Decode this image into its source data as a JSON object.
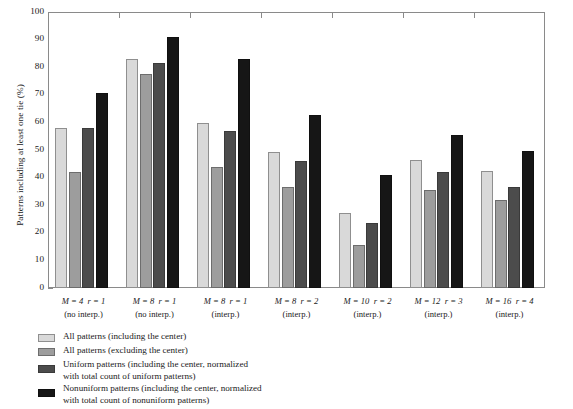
{
  "chart_data": {
    "type": "bar",
    "title": "",
    "xlabel": "",
    "ylabel": "Patterns including at least one tie (%)",
    "ylim": [
      0,
      100
    ],
    "ytick_labels": [
      "0",
      "10",
      "20",
      "30",
      "40",
      "50",
      "60",
      "70",
      "80",
      "90",
      "100"
    ],
    "ytick_values": [
      0,
      10,
      20,
      30,
      40,
      50,
      60,
      70,
      80,
      90,
      100
    ],
    "grid": false,
    "legend_position": "below-plot-left",
    "categories": [
      {
        "line1": "M = 4  r = 1",
        "line2": "(no interp.)",
        "M": "4",
        "r": "1"
      },
      {
        "line1": "M = 8  r = 1",
        "line2": "(no interp.)",
        "M": "8",
        "r": "1"
      },
      {
        "line1": "M = 8  r = 1",
        "line2": "(interp.)",
        "M": "8",
        "r": "1"
      },
      {
        "line1": "M = 8  r = 2",
        "line2": "(interp.)",
        "M": "8",
        "r": "2"
      },
      {
        "line1": "M = 10  r = 2",
        "line2": "(interp.)",
        "M": "10",
        "r": "2"
      },
      {
        "line1": "M = 12  r = 3",
        "line2": "(interp.)",
        "M": "12",
        "r": "3"
      },
      {
        "line1": "M = 16  r = 4",
        "line2": "(interp.)",
        "M": "16",
        "r": "4"
      }
    ],
    "series": [
      {
        "name": "All patterns (including the center)",
        "color": "#d9d9d9",
        "values": [
          58.0,
          83.0,
          59.8,
          49.2,
          27.2,
          46.5,
          42.5
        ]
      },
      {
        "name": "All patterns (excluding the center)",
        "color": "#9d9d9d",
        "values": [
          42.0,
          77.5,
          43.8,
          36.5,
          15.5,
          35.5,
          32.0
        ]
      },
      {
        "name": "Uniform patterns (including the center, normalized with total count of uniform patterns)",
        "color": "#4c4c4c",
        "values": [
          57.8,
          81.5,
          57.0,
          46.0,
          23.5,
          42.0,
          36.5
        ]
      },
      {
        "name": "Nonuniform patterns (including the center, normalized with total count of nonuniform patterns)",
        "color": "#161616",
        "values": [
          70.8,
          91.0,
          83.0,
          62.8,
          41.0,
          55.5,
          49.5
        ]
      }
    ]
  },
  "legend": [
    {
      "swatch": "s0",
      "line1": "All patterns (including the center)",
      "line2": ""
    },
    {
      "swatch": "s1",
      "line1": "All patterns (excluding the center)",
      "line2": ""
    },
    {
      "swatch": "s2",
      "line1": "Uniform patterns (including the center, normalized",
      "line2": "with total count of uniform patterns)"
    },
    {
      "swatch": "s3",
      "line1": "Nonuniform patterns (including the center, normalized",
      "line2": "with total count of nonuniform patterns)"
    }
  ]
}
